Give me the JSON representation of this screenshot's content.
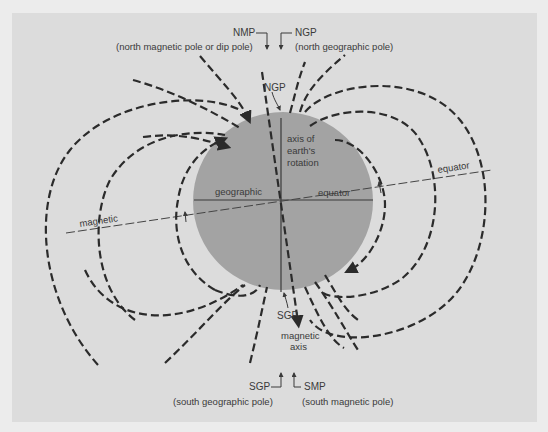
{
  "figure": {
    "colors": {
      "page_bg": "#ececec",
      "panel_bg": "#dcdcdc",
      "globe": "#a3a3a3",
      "field_lines": "#2b2b2b",
      "text": "#3a3a3a"
    },
    "labels": {
      "nmp": "NMP",
      "nmp_desc": "(north magnetic pole or dip pole)",
      "ngp_top": "NGP",
      "ngp_top_desc": "(north geographic pole)",
      "ngp_globe": "NGP",
      "axis_rotation_1": "axis of",
      "axis_rotation_2": "earth's",
      "axis_rotation_3": "rotation",
      "geographic": "geographic",
      "equator_geo": "equator",
      "magnetic": "magnetic",
      "equator_mag": "equator",
      "sgp_globe": "SGP",
      "magnetic_axis_1": "magnetic",
      "magnetic_axis_2": "axis",
      "sgp": "SGP",
      "sgp_desc": "(south geographic pole)",
      "smp": "SMP",
      "smp_desc": "(south magnetic pole)"
    }
  }
}
